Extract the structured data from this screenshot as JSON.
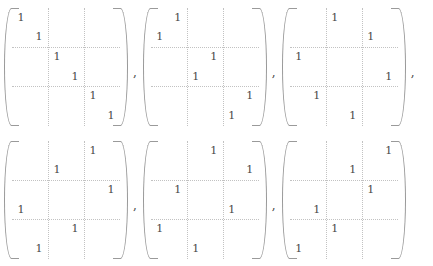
{
  "figure": {
    "kind": "matrix-list",
    "matrix_size": 6,
    "block_partition": 2,
    "separator": ",",
    "entry_symbol": "1",
    "empty_symbol": "",
    "colors": {
      "background": "#ffffff",
      "entry_text": "#4a4a4a",
      "partition_line": "#c2c2c2",
      "bracket": "#9a9a9a"
    },
    "rows": [
      {
        "matrices": [
          {
            "name": "matrix-1",
            "label": "identity",
            "permutation": [
              1,
              2,
              3,
              4,
              5,
              6
            ],
            "entries": [
              [
                "1",
                "",
                "",
                "",
                "",
                ""
              ],
              [
                "",
                "1",
                "",
                "",
                "",
                ""
              ],
              [
                "",
                "",
                "1",
                "",
                "",
                ""
              ],
              [
                "",
                "",
                "",
                "1",
                "",
                ""
              ],
              [
                "",
                "",
                "",
                "",
                "1",
                ""
              ],
              [
                "",
                "",
                "",
                "",
                "",
                "1"
              ]
            ],
            "trailing_separator": ","
          },
          {
            "name": "matrix-2",
            "label": "permutation",
            "permutation": [
              2,
              1,
              4,
              3,
              6,
              5
            ],
            "entries": [
              [
                "",
                "1",
                "",
                "",
                "",
                ""
              ],
              [
                "1",
                "",
                "",
                "",
                "",
                ""
              ],
              [
                "",
                "",
                "",
                "1",
                "",
                ""
              ],
              [
                "",
                "",
                "1",
                "",
                "",
                ""
              ],
              [
                "",
                "",
                "",
                "",
                "",
                "1"
              ],
              [
                "",
                "",
                "",
                "",
                "1",
                ""
              ]
            ],
            "trailing_separator": ","
          },
          {
            "name": "matrix-3",
            "label": "permutation",
            "permutation": [
              3,
              5,
              1,
              6,
              2,
              4
            ],
            "entries": [
              [
                "",
                "",
                "1",
                "",
                "",
                ""
              ],
              [
                "",
                "",
                "",
                "",
                "1",
                ""
              ],
              [
                "1",
                "",
                "",
                "",
                "",
                ""
              ],
              [
                "",
                "",
                "",
                "",
                "",
                "1"
              ],
              [
                "",
                "1",
                "",
                "",
                "",
                ""
              ],
              [
                "",
                "",
                "",
                "1",
                "",
                ""
              ]
            ],
            "trailing_separator": ","
          }
        ]
      },
      {
        "matrices": [
          {
            "name": "matrix-4",
            "label": "permutation",
            "permutation": [
              5,
              3,
              6,
              1,
              4,
              2
            ],
            "entries": [
              [
                "",
                "",
                "",
                "",
                "1",
                ""
              ],
              [
                "",
                "",
                "1",
                "",
                "",
                ""
              ],
              [
                "",
                "",
                "",
                "",
                "",
                "1"
              ],
              [
                "1",
                "",
                "",
                "",
                "",
                ""
              ],
              [
                "",
                "",
                "",
                "1",
                "",
                ""
              ],
              [
                "",
                "1",
                "",
                "",
                "",
                ""
              ]
            ],
            "trailing_separator": ","
          },
          {
            "name": "matrix-5",
            "label": "permutation",
            "permutation": [
              4,
              6,
              2,
              5,
              1,
              3
            ],
            "entries": [
              [
                "",
                "",
                "",
                "1",
                "",
                ""
              ],
              [
                "",
                "",
                "",
                "",
                "",
                "1"
              ],
              [
                "",
                "1",
                "",
                "",
                "",
                ""
              ],
              [
                "",
                "",
                "",
                "",
                "1",
                ""
              ],
              [
                "1",
                "",
                "",
                "",
                "",
                ""
              ],
              [
                "",
                "",
                "1",
                "",
                "",
                ""
              ]
            ],
            "trailing_separator": ","
          },
          {
            "name": "matrix-6",
            "label": "permutation",
            "permutation": [
              6,
              4,
              5,
              2,
              3,
              1
            ],
            "entries": [
              [
                "",
                "",
                "",
                "",
                "",
                "1"
              ],
              [
                "",
                "",
                "",
                "1",
                "",
                ""
              ],
              [
                "",
                "",
                "",
                "",
                "1",
                ""
              ],
              [
                "",
                "1",
                "",
                "",
                "",
                ""
              ],
              [
                "",
                "",
                "1",
                "",
                "",
                ""
              ],
              [
                "1",
                "",
                "",
                "",
                "",
                ""
              ]
            ],
            "trailing_separator": ""
          }
        ]
      }
    ]
  }
}
